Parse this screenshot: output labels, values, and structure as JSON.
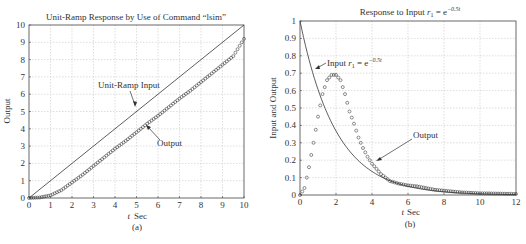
{
  "chart_data": [
    {
      "type": "line",
      "panel": "(a)",
      "title": "Unit-Ramp Response by Use of Command \"lsim\"",
      "xlabel": "t  Sec",
      "ylabel": "Output",
      "xlim": [
        0,
        10
      ],
      "ylim": [
        0,
        10
      ],
      "xticks": [
        0,
        1,
        2,
        3,
        4,
        5,
        6,
        7,
        8,
        9,
        10
      ],
      "yticks": [
        0,
        1,
        2,
        3,
        4,
        5,
        6,
        7,
        8,
        9,
        10
      ],
      "grid": true,
      "annotations": [
        "Unit-Ramp Input",
        "Output"
      ],
      "series": [
        {
          "name": "Unit-Ramp Input",
          "style": "solid-line",
          "x": [
            0,
            10
          ],
          "y": [
            0,
            10
          ]
        },
        {
          "name": "Output",
          "style": "circle-markers",
          "x": [
            0,
            0.5,
            1,
            1.5,
            2,
            2.5,
            3,
            3.5,
            4,
            4.5,
            5,
            5.5,
            6,
            6.5,
            7,
            7.5,
            8,
            8.5,
            9,
            9.5,
            10
          ],
          "y": [
            0,
            0.03,
            0.15,
            0.45,
            0.9,
            1.35,
            1.85,
            2.35,
            2.85,
            3.3,
            3.8,
            4.3,
            4.75,
            5.25,
            5.75,
            6.2,
            6.7,
            7.2,
            7.7,
            8.2,
            9.2
          ]
        }
      ]
    },
    {
      "type": "line",
      "panel": "(b)",
      "title": "Response to Input r₁ = e^(−0.5t)",
      "xlabel": "t Sec",
      "ylabel": "Input and Output",
      "xlim": [
        0,
        12
      ],
      "ylim": [
        0,
        1
      ],
      "xticks": [
        0,
        2,
        4,
        6,
        8,
        10,
        12
      ],
      "yticks": [
        0,
        0.1,
        0.2,
        0.3,
        0.4,
        0.5,
        0.6,
        0.7,
        0.8,
        0.9,
        1
      ],
      "grid": true,
      "annotations": [
        "Input r₁ = e^(−0.5t)",
        "Output"
      ],
      "series": [
        {
          "name": "Input r1 = e^-0.5t",
          "style": "solid-line",
          "x": [
            0,
            1,
            2,
            3,
            4,
            5,
            6,
            7,
            8,
            9,
            10,
            11,
            12
          ],
          "y": [
            1,
            0.61,
            0.37,
            0.22,
            0.14,
            0.08,
            0.05,
            0.03,
            0.02,
            0.01,
            0.007,
            0.004,
            0.002
          ]
        },
        {
          "name": "Output",
          "style": "circle-markers",
          "x": [
            0,
            0.25,
            0.5,
            0.75,
            1,
            1.25,
            1.5,
            1.75,
            2,
            2.25,
            2.5,
            2.75,
            3,
            3.25,
            3.5,
            3.75,
            4,
            4.5,
            5,
            5.5,
            6,
            6.5,
            7,
            7.5,
            8,
            9,
            10,
            11,
            12
          ],
          "y": [
            0,
            0.04,
            0.16,
            0.3,
            0.45,
            0.58,
            0.66,
            0.69,
            0.69,
            0.66,
            0.58,
            0.48,
            0.41,
            0.33,
            0.27,
            0.22,
            0.18,
            0.12,
            0.08,
            0.065,
            0.055,
            0.05,
            0.04,
            0.03,
            0.025,
            0.015,
            0.01,
            0.008,
            0.006
          ]
        }
      ]
    }
  ],
  "labels": {
    "a_title": "Unit-Ramp Response by Use of Command “lsim”",
    "a_xlabel_t": "t",
    "a_xlabel_sec": "Sec",
    "a_ylabel": "Output",
    "a_panel": "(a)",
    "a_ann_input": "Unit-Ramp Input",
    "a_ann_output": "Output",
    "b_title_pre": "Response to Input ",
    "b_title_r": "r",
    "b_title_sub": "1",
    "b_title_eq": " = e",
    "b_title_exp": "−0.5t",
    "b_xlabel_t": "t",
    "b_xlabel_sec": "Sec",
    "b_ylabel": "Input and Output",
    "b_panel": "(b)",
    "b_ann_input_pre": "Input ",
    "b_ann_input_r": "r",
    "b_ann_input_sub": "1",
    "b_ann_input_eq": " = e",
    "b_ann_input_exp": "−0.5t",
    "b_ann_output": "Output"
  }
}
